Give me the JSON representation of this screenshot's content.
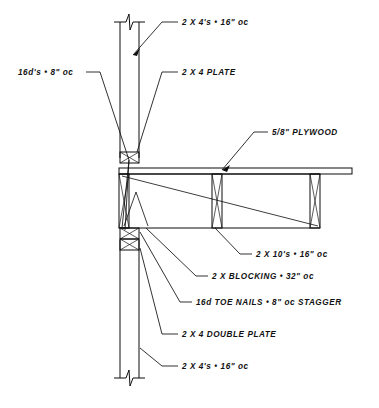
{
  "drawing": {
    "title": "Wall and Floor Framing Section Detail",
    "background_color": "#ffffff",
    "line_color": "#0d0d0d",
    "annotations": [
      {
        "id": "studs-upper",
        "name": "2 X 4's @ 16\" oc (upper wall)",
        "text": "2 X 4's • 16\" oc",
        "x": 182,
        "y": 25,
        "anchor": "start"
      },
      {
        "id": "plate-single",
        "name": "2 X 4 PLATE",
        "text": "2 X 4 PLATE",
        "x": 182,
        "y": 75,
        "anchor": "start"
      },
      {
        "id": "nails-16d",
        "name": "16d's @ 8\" oc",
        "text": "16d's • 8\" oc",
        "x": 18,
        "y": 75,
        "anchor": "start"
      },
      {
        "id": "plywood",
        "name": "5/8\" PLYWOOD",
        "text": "5/8\" PLYWOOD",
        "x": 272,
        "y": 135,
        "anchor": "start"
      },
      {
        "id": "joists",
        "name": "2 X 10's @ 16\" oc",
        "text": "2 X 10's • 16\" oc",
        "x": 256,
        "y": 257,
        "anchor": "start"
      },
      {
        "id": "blocking",
        "name": "2 X BLOCKING @ 32\" oc",
        "text": "2 X BLOCKING • 32\" oc",
        "x": 212,
        "y": 279,
        "anchor": "start"
      },
      {
        "id": "toe-nails",
        "name": "16d TOE NAILS @ 8\" oc STAGGER",
        "text": "16d TOE NAILS • 8\" oc STAGGER",
        "x": 196,
        "y": 305,
        "anchor": "start"
      },
      {
        "id": "double-plate",
        "name": "2 X 4 DOUBLE PLATE",
        "text": "2 X 4 DOUBLE PLATE",
        "x": 182,
        "y": 337,
        "anchor": "start"
      },
      {
        "id": "studs-lower",
        "name": "2 X 4's @ 16\" oc (lower wall)",
        "text": "2 X 4's • 16\" oc",
        "x": 182,
        "y": 369,
        "anchor": "start"
      }
    ],
    "components": [
      {
        "id": "upper-wall",
        "label": "upper stud wall"
      },
      {
        "id": "lower-wall",
        "label": "lower stud wall"
      },
      {
        "id": "top-plate",
        "label": "single top plate"
      },
      {
        "id": "double-top-plate",
        "label": "double top plate"
      },
      {
        "id": "floor-joist",
        "label": "2x10 floor joist"
      },
      {
        "id": "subfloor",
        "label": "5/8 inch plywood subfloor"
      },
      {
        "id": "blocking-member",
        "label": "2x solid blocking"
      },
      {
        "id": "break-symbol-top",
        "label": "break line symbol top"
      },
      {
        "id": "break-symbol-bottom",
        "label": "break line symbol bottom"
      }
    ]
  }
}
